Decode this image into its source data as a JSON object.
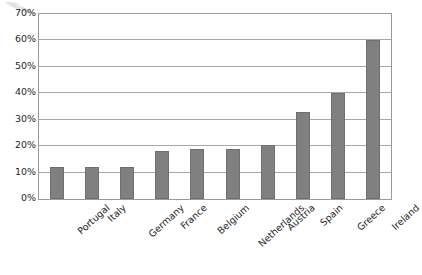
{
  "chart_data": {
    "type": "bar",
    "title": "",
    "xlabel": "",
    "ylabel": "",
    "categories": [
      "Portugal",
      "Italy",
      "Germany",
      "France",
      "Belgium",
      "Netherlands",
      "Austria",
      "Spain",
      "Greece",
      "Ireland"
    ],
    "values": [
      12,
      12,
      12,
      18,
      19,
      19,
      20.5,
      33,
      40,
      60
    ],
    "ylim": [
      0,
      70
    ],
    "ytick_labels": [
      "0%",
      "10%",
      "20%",
      "30%",
      "40%",
      "50%",
      "60%",
      "70%"
    ],
    "ytick_values": [
      0,
      10,
      20,
      30,
      40,
      50,
      60,
      70
    ],
    "grid": true,
    "legend": false,
    "series": [
      {
        "name": "",
        "values": [
          12,
          12,
          12,
          18,
          19,
          19,
          20.5,
          33,
          40,
          60
        ]
      }
    ]
  },
  "style": {
    "bar_color": "#808080",
    "gridline_color": "#a8a8a8",
    "plot_border_color": "#9a9a9a",
    "background_color": "#ffffff",
    "text_color": "#1f1f1f"
  },
  "artifacts": {
    "scan_smudge": "scan-smudge-mark"
  }
}
